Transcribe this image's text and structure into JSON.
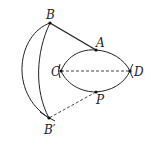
{
  "diagram": {
    "type": "geometric construction",
    "points": [
      {
        "id": "B",
        "label": "B"
      },
      {
        "id": "A",
        "label": "A"
      },
      {
        "id": "C",
        "label": "C"
      },
      {
        "id": "D",
        "label": "D"
      },
      {
        "id": "P",
        "label": "P"
      },
      {
        "id": "Bp",
        "label": "B′"
      }
    ],
    "segments": [
      {
        "from": "B",
        "to": "A",
        "style": "solid"
      },
      {
        "from": "C",
        "to": "D",
        "style": "dashed"
      },
      {
        "from": "P",
        "to": "Bp",
        "style": "dashed"
      }
    ],
    "arcs": [
      {
        "name": "upper arc C-A-D",
        "through": [
          "C",
          "A",
          "D"
        ]
      },
      {
        "name": "lower arc C-P-D",
        "through": [
          "C",
          "P",
          "D"
        ]
      },
      {
        "name": "outer arc B to B′",
        "through": [
          "B",
          "Bp"
        ]
      },
      {
        "name": "inner arc B to B′",
        "through": [
          "B",
          "Bp"
        ]
      }
    ],
    "colors": {
      "stroke": "#222222",
      "background": "#ffffff"
    }
  }
}
